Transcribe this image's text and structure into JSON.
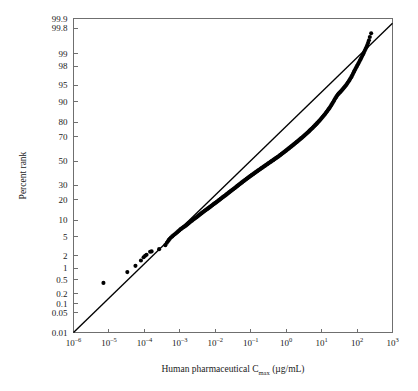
{
  "figure": {
    "background_color": "#ffffff",
    "ink_color": "#000000",
    "axis_color": "#6f6f6f"
  },
  "chart_data": {
    "type": "scatter",
    "title": "",
    "subtitle": "",
    "xlabel": "Human pharmaceutical Cmax (µg/mL)",
    "xlabel_parts": {
      "main": "Human pharmaceutical C",
      "subscript": "max",
      "units": "(µg/mL)"
    },
    "ylabel": "Percent rank",
    "x_scale": "log10",
    "y_scale": "normal-probability",
    "xlim": [
      1e-06,
      1000
    ],
    "ylim": [
      0.01,
      99.9
    ],
    "grid": false,
    "legend": null,
    "x_ticks": [
      {
        "value": 1e-06,
        "mantissa": "10",
        "exponent": "–6"
      },
      {
        "value": 1e-05,
        "mantissa": "10",
        "exponent": "–5"
      },
      {
        "value": 0.0001,
        "mantissa": "10",
        "exponent": "–4"
      },
      {
        "value": 0.001,
        "mantissa": "10",
        "exponent": "–3"
      },
      {
        "value": 0.01,
        "mantissa": "10",
        "exponent": "–2"
      },
      {
        "value": 0.1,
        "mantissa": "10",
        "exponent": "–1"
      },
      {
        "value": 1,
        "mantissa": "10",
        "exponent": "0"
      },
      {
        "value": 10,
        "mantissa": "10",
        "exponent": "1"
      },
      {
        "value": 100,
        "mantissa": "10",
        "exponent": "2"
      },
      {
        "value": 1000,
        "mantissa": "10",
        "exponent": "3"
      }
    ],
    "y_ticks": [
      99.9,
      99.8,
      99,
      98,
      95,
      90,
      80,
      70,
      50,
      30,
      20,
      10,
      5,
      2,
      1,
      0.5,
      0.2,
      0.1,
      0.05,
      0.01
    ],
    "y_tick_labels": [
      "99.9",
      "99.8",
      "99",
      "98",
      "95",
      "90",
      "80",
      "70",
      "50",
      "30",
      "20",
      "10",
      "5",
      "2",
      "1",
      "0.5",
      "0.2",
      "0.1",
      "0.05",
      "0.01"
    ],
    "reference_line": {
      "description": "straight fitted lognormal reference line",
      "endpoints": [
        {
          "x": 1e-06,
          "percent_rank": 0.01
        },
        {
          "x": 1000.0,
          "percent_rank": 99.86
        }
      ]
    },
    "series": [
      {
        "name": "Human pharmaceutical Cmax",
        "marker": "filled-circle",
        "color": "#000000",
        "n_points": 242,
        "points": [
          [
            7e-06,
            0.41
          ],
          [
            3.3e-05,
            0.8
          ],
          [
            5.6e-05,
            1.15
          ],
          [
            8e-05,
            1.55
          ],
          [
            9.5e-05,
            1.85
          ],
          [
            0.000105,
            2.0
          ],
          [
            0.000115,
            2.1
          ],
          [
            0.000145,
            2.45
          ],
          [
            0.00016,
            2.5
          ],
          [
            0.00026,
            2.8
          ],
          [
            0.00039,
            3.4
          ],
          [
            0.00043,
            3.8
          ],
          [
            0.00046,
            4.1
          ],
          [
            0.00049,
            4.35
          ],
          [
            0.00052,
            4.6
          ],
          [
            0.00056,
            4.85
          ],
          [
            0.00061,
            5.1
          ],
          [
            0.00066,
            5.35
          ],
          [
            0.00072,
            5.6
          ],
          [
            0.00078,
            5.85
          ],
          [
            0.00084,
            6.1
          ],
          [
            0.0009,
            6.35
          ],
          [
            0.00096,
            6.6
          ],
          [
            0.00102,
            6.85
          ],
          [
            0.00108,
            7.05
          ],
          [
            0.00115,
            7.25
          ],
          [
            0.00122,
            7.45
          ],
          [
            0.0013,
            7.65
          ],
          [
            0.00138,
            7.85
          ],
          [
            0.00146,
            8.05
          ],
          [
            0.00155,
            8.3
          ],
          [
            0.00164,
            8.55
          ],
          [
            0.00174,
            8.8
          ],
          [
            0.00184,
            9.05
          ],
          [
            0.00195,
            9.3
          ],
          [
            0.00206,
            9.55
          ],
          [
            0.00218,
            9.8
          ],
          [
            0.0023,
            10.05
          ],
          [
            0.00243,
            10.3
          ],
          [
            0.00257,
            10.55
          ],
          [
            0.00272,
            10.8
          ],
          [
            0.00288,
            11.05
          ],
          [
            0.00305,
            11.3
          ],
          [
            0.00322,
            11.6
          ],
          [
            0.0034,
            11.9
          ],
          [
            0.0036,
            12.2
          ],
          [
            0.0038,
            12.5
          ],
          [
            0.00402,
            12.8
          ],
          [
            0.00425,
            13.1
          ],
          [
            0.00449,
            13.4
          ],
          [
            0.00475,
            13.7
          ],
          [
            0.00502,
            14.0
          ],
          [
            0.0053,
            14.3
          ],
          [
            0.0056,
            14.6
          ],
          [
            0.00592,
            14.9
          ],
          [
            0.00625,
            15.2
          ],
          [
            0.0066,
            15.5
          ],
          [
            0.00697,
            15.85
          ],
          [
            0.00736,
            16.2
          ],
          [
            0.00778,
            16.55
          ],
          [
            0.00822,
            16.9
          ],
          [
            0.00868,
            17.25
          ],
          [
            0.00917,
            17.6
          ],
          [
            0.00968,
            17.95
          ],
          [
            0.01022,
            18.3
          ],
          [
            0.01079,
            18.65
          ],
          [
            0.0114,
            19.0
          ],
          [
            0.01204,
            19.4
          ],
          [
            0.01271,
            19.8
          ],
          [
            0.01342,
            20.2
          ],
          [
            0.01417,
            20.6
          ],
          [
            0.01497,
            21.0
          ],
          [
            0.0158,
            21.4
          ],
          [
            0.01669,
            21.8
          ],
          [
            0.01762,
            22.2
          ],
          [
            0.01861,
            22.6
          ],
          [
            0.01965,
            23.0
          ],
          [
            0.02075,
            23.45
          ],
          [
            0.0219,
            23.9
          ],
          [
            0.02313,
            24.35
          ],
          [
            0.02442,
            24.8
          ],
          [
            0.02578,
            25.25
          ],
          [
            0.02722,
            25.7
          ],
          [
            0.02874,
            26.15
          ],
          [
            0.03035,
            26.6
          ],
          [
            0.03204,
            27.05
          ],
          [
            0.03383,
            27.5
          ],
          [
            0.03572,
            27.95
          ],
          [
            0.03772,
            28.45
          ],
          [
            0.03983,
            28.95
          ],
          [
            0.04205,
            29.45
          ],
          [
            0.0444,
            29.95
          ],
          [
            0.04688,
            30.45
          ],
          [
            0.0495,
            30.95
          ],
          [
            0.05227,
            31.45
          ],
          [
            0.05519,
            31.95
          ],
          [
            0.05827,
            32.45
          ],
          [
            0.06153,
            32.95
          ],
          [
            0.06497,
            33.45
          ],
          [
            0.0686,
            33.95
          ],
          [
            0.07243,
            34.45
          ],
          [
            0.07648,
            34.95
          ],
          [
            0.08075,
            35.45
          ],
          [
            0.08526,
            35.95
          ],
          [
            0.09003,
            36.45
          ],
          [
            0.09506,
            36.95
          ],
          [
            0.10037,
            37.45
          ],
          [
            0.10598,
            37.95
          ],
          [
            0.1119,
            38.45
          ],
          [
            0.11815,
            38.95
          ],
          [
            0.12475,
            39.45
          ],
          [
            0.13172,
            39.95
          ],
          [
            0.13908,
            40.45
          ],
          [
            0.14685,
            40.95
          ],
          [
            0.15505,
            41.45
          ],
          [
            0.16372,
            41.95
          ],
          [
            0.17287,
            42.45
          ],
          [
            0.18253,
            42.95
          ],
          [
            0.19272,
            43.45
          ],
          [
            0.20349,
            43.95
          ],
          [
            0.21486,
            44.45
          ],
          [
            0.22687,
            44.95
          ],
          [
            0.23954,
            45.45
          ],
          [
            0.25293,
            45.95
          ],
          [
            0.26706,
            46.45
          ],
          [
            0.28198,
            46.95
          ],
          [
            0.29773,
            47.45
          ],
          [
            0.31437,
            47.95
          ],
          [
            0.33193,
            48.45
          ],
          [
            0.35048,
            48.95
          ],
          [
            0.37006,
            49.45
          ],
          [
            0.39074,
            49.95
          ],
          [
            0.41257,
            50.45
          ],
          [
            0.43562,
            50.95
          ],
          [
            0.45996,
            51.45
          ],
          [
            0.48566,
            51.95
          ],
          [
            0.51279,
            52.45
          ],
          [
            0.54144,
            52.95
          ],
          [
            0.57169,
            53.45
          ],
          [
            0.60363,
            53.95
          ],
          [
            0.63736,
            54.5
          ],
          [
            0.67297,
            55.05
          ],
          [
            0.71057,
            55.6
          ],
          [
            0.75027,
            56.15
          ],
          [
            0.79218,
            56.7
          ],
          [
            0.83644,
            57.25
          ],
          [
            0.88317,
            57.8
          ],
          [
            0.93251,
            58.35
          ],
          [
            0.98462,
            58.9
          ],
          [
            1.0396,
            59.45
          ],
          [
            1.0977,
            60.0
          ],
          [
            1.159,
            60.55
          ],
          [
            1.2238,
            61.1
          ],
          [
            1.2921,
            61.65
          ],
          [
            1.3643,
            62.2
          ],
          [
            1.4406,
            62.75
          ],
          [
            1.5211,
            63.3
          ],
          [
            1.6061,
            63.85
          ],
          [
            1.6958,
            64.4
          ],
          [
            1.7905,
            64.95
          ],
          [
            1.8906,
            65.5
          ],
          [
            1.9962,
            66.05
          ],
          [
            2.1078,
            66.6
          ],
          [
            2.2256,
            67.15
          ],
          [
            2.3499,
            67.7
          ],
          [
            2.4812,
            68.25
          ],
          [
            2.6199,
            68.8
          ],
          [
            2.7663,
            69.35
          ],
          [
            2.9209,
            69.9
          ],
          [
            3.0841,
            70.45
          ],
          [
            3.2564,
            71.0
          ],
          [
            3.4383,
            71.55
          ],
          [
            3.6304,
            72.1
          ],
          [
            3.8333,
            72.65
          ],
          [
            4.0475,
            73.2
          ],
          [
            4.2736,
            73.75
          ],
          [
            4.5124,
            74.3
          ],
          [
            4.7645,
            74.85
          ],
          [
            5.0307,
            75.4
          ],
          [
            5.3118,
            75.95
          ],
          [
            5.6086,
            76.5
          ],
          [
            5.9219,
            77.05
          ],
          [
            6.2528,
            77.6
          ],
          [
            6.6022,
            78.15
          ],
          [
            6.971,
            78.7
          ],
          [
            7.3605,
            79.25
          ],
          [
            7.7717,
            79.8
          ],
          [
            8.2059,
            80.35
          ],
          [
            8.6644,
            80.9
          ],
          [
            9.1485,
            81.45
          ],
          [
            9.6597,
            82.0
          ],
          [
            10.1996,
            82.55
          ],
          [
            10.7696,
            83.1
          ],
          [
            11.3714,
            83.65
          ],
          [
            12.0068,
            84.2
          ],
          [
            12.6777,
            84.75
          ],
          [
            13.3861,
            85.3
          ],
          [
            14.134,
            85.85
          ],
          [
            14.9237,
            86.4
          ],
          [
            15.7576,
            86.95
          ],
          [
            16.6381,
            87.5
          ],
          [
            17.5678,
            88.05
          ],
          [
            18.5497,
            88.6
          ],
          [
            19.5864,
            89.15
          ],
          [
            20.6811,
            89.7
          ],
          [
            21.837,
            90.25
          ],
          [
            23.0575,
            90.8
          ],
          [
            24.3462,
            91.3
          ],
          [
            25.7069,
            91.75
          ],
          [
            27.1436,
            92.15
          ],
          [
            28.6605,
            92.5
          ],
          [
            30.2622,
            92.8
          ],
          [
            31.9534,
            93.05
          ],
          [
            33.7391,
            93.3
          ],
          [
            35.6246,
            93.55
          ],
          [
            37.6155,
            93.8
          ],
          [
            39.7177,
            94.05
          ],
          [
            41.9375,
            94.3
          ],
          [
            44.2815,
            94.55
          ],
          [
            46.7567,
            94.8
          ],
          [
            49.3706,
            95.05
          ],
          [
            52.1311,
            95.3
          ],
          [
            55.0464,
            95.55
          ],
          [
            58.1256,
            95.8
          ],
          [
            61.3779,
            96.05
          ],
          [
            64.8134,
            96.3
          ],
          [
            68.4425,
            96.55
          ],
          [
            72.2764,
            96.8
          ],
          [
            76.3269,
            97.05
          ],
          [
            80.6065,
            97.3
          ],
          [
            85.1285,
            97.5
          ],
          [
            89.9069,
            97.7
          ],
          [
            94.9566,
            97.9
          ],
          [
            100.2934,
            98.05
          ],
          [
            105.9341,
            98.2
          ],
          [
            111.8965,
            98.35
          ],
          [
            118.1993,
            98.5
          ],
          [
            124.8625,
            98.62
          ],
          [
            131.9072,
            98.74
          ],
          [
            139.3558,
            98.86
          ],
          [
            147.232,
            98.96
          ],
          [
            155.5606,
            99.06
          ],
          [
            164.3683,
            99.16
          ],
          [
            173.6831,
            99.24
          ],
          [
            183.5349,
            99.32
          ],
          [
            193.9553,
            99.4
          ],
          [
            204.9779,
            99.48
          ],
          [
            216.6383,
            99.56
          ],
          [
            228.9745,
            99.64
          ],
          [
            250.0,
            99.72
          ]
        ]
      }
    ]
  }
}
